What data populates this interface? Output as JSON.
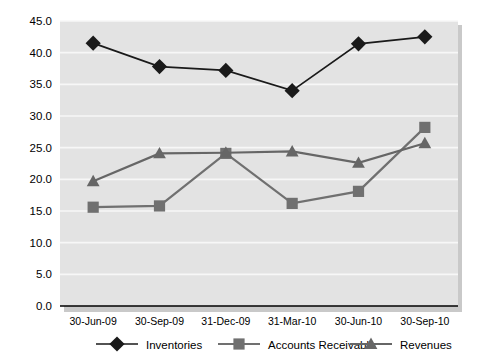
{
  "chart_data": {
    "type": "line",
    "title": "",
    "subtitle": "",
    "xlabel": "",
    "ylabel": "",
    "categories": [
      "30-Jun-09",
      "30-Sep-09",
      "31-Dec-09",
      "31-Mar-10",
      "30-Jun-10",
      "30-Sep-10"
    ],
    "ylim": [
      0.0,
      45.0
    ],
    "ytick_labels": [
      "0.0",
      "5.0",
      "10.0",
      "15.0",
      "20.0",
      "25.0",
      "30.0",
      "35.0",
      "40.0",
      "45.0"
    ],
    "ytick_values": [
      0.0,
      5.0,
      10.0,
      15.0,
      20.0,
      25.0,
      30.0,
      35.0,
      40.0,
      45.0
    ],
    "grid": true,
    "legend_position": "bottom",
    "series": [
      {
        "name": "Inventories",
        "marker": "diamond",
        "color": "#1a1a1a",
        "values": [
          41.5,
          37.8,
          37.2,
          34.0,
          41.4,
          42.5
        ]
      },
      {
        "name": "Accounts Receivable",
        "marker": "square",
        "color": "#707070",
        "values": [
          15.6,
          15.8,
          24.1,
          16.2,
          18.1,
          28.2
        ]
      },
      {
        "name": "Revenues",
        "marker": "triangle",
        "color": "#666666",
        "values": [
          19.7,
          24.1,
          24.2,
          24.4,
          22.6,
          25.7
        ]
      }
    ]
  },
  "colors": {
    "plot_background": "#e3e3e3",
    "gridline": "#f7f7f7",
    "axis": "#000000",
    "inventories": "#1a1a1a",
    "accounts_receivable": "#707070",
    "revenues": "#666666"
  }
}
